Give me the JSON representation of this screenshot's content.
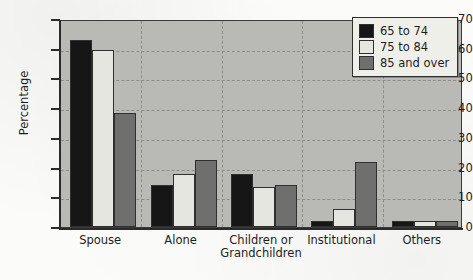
{
  "chart_data": {
    "type": "bar",
    "title": "",
    "xlabel": "",
    "ylabel": "Percentage",
    "ylim": [
      0,
      70
    ],
    "ytick_step": 10,
    "yticks": [
      70,
      60,
      50,
      40,
      30,
      20,
      10,
      0
    ],
    "grid": true,
    "legend_position": "top-right",
    "categories": [
      "Spouse",
      "Alone",
      "Children or Grandchildren",
      "Institutional",
      "Others"
    ],
    "category_lines": [
      [
        "Spouse"
      ],
      [
        "Alone"
      ],
      [
        "Children or",
        "Grandchildren"
      ],
      [
        "Institutional"
      ],
      [
        "Others"
      ]
    ],
    "series": [
      {
        "name": "65 to 74",
        "color": "#161616",
        "values": [
          63,
          14,
          18,
          2,
          2
        ]
      },
      {
        "name": "75 to 84",
        "color": "#e6e6e1",
        "values": [
          59.5,
          18,
          13.5,
          6,
          2
        ]
      },
      {
        "name": "85 and over",
        "color": "#6f6f6e",
        "values": [
          38.5,
          22.5,
          14,
          22,
          2
        ]
      }
    ]
  },
  "legend": {
    "items": [
      {
        "label": "65 to 74"
      },
      {
        "label": "75 to 84"
      },
      {
        "label": "85 and over"
      }
    ]
  },
  "axes": {
    "y_title": "Percentage",
    "y_tick_labels": [
      "70",
      "60",
      "50",
      "40",
      "30",
      "20",
      "10",
      "0"
    ]
  }
}
